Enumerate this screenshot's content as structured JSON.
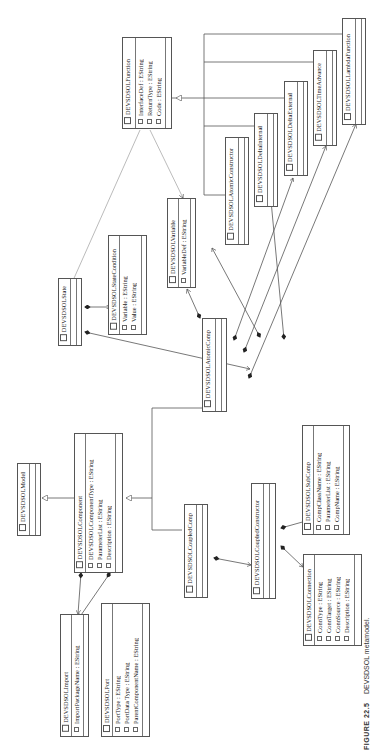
{
  "caption": {
    "label": "FIGURE 22.5",
    "text": "DEVSDSOL metamodel."
  },
  "classes": {
    "function": {
      "name": "DEVSDSOLFunction",
      "attributes": [
        "InterfaceDef : EString",
        "ReturnType : EString",
        "Code : EString"
      ]
    },
    "lambda": {
      "name": "DEVSDSOLLambdaFunction",
      "attributes": []
    },
    "time_advance": {
      "name": "DEVSDSOLTimeAdvance",
      "attributes": []
    },
    "delta_external": {
      "name": "DEVSDSOLDeltaExternal",
      "attributes": []
    },
    "delta_internal": {
      "name": "DEVSDSOLDeltaInternal",
      "attributes": []
    },
    "atomic_constructor": {
      "name": "DEVSDSOLAtomicConstructor",
      "attributes": []
    },
    "variable": {
      "name": "DEVSDSOLVariable",
      "attributes": [
        "VariableDef : EString"
      ]
    },
    "state_condition": {
      "name": "DEVSDSOLStateCondition",
      "attributes": [
        "Variable : EString",
        "Value : EString"
      ]
    },
    "state": {
      "name": "DEVSDSOLState",
      "attributes": []
    },
    "atomic_comp": {
      "name": "DEVSDSOLAtomicComp",
      "attributes": []
    },
    "model": {
      "name": "DEVSDSOLModel",
      "attributes": []
    },
    "component": {
      "name": "DEVSDSOLComponent",
      "attributes": [
        "DEVSDSOLComponentType : EString",
        "ParameterList : EString",
        "Description : EString"
      ]
    },
    "coupled_comp": {
      "name": "DEVSDSOLCoupledComp",
      "attributes": []
    },
    "coupled_constructor": {
      "name": "DEVSDSOLCoupledConstructor",
      "attributes": []
    },
    "sub_comp": {
      "name": "DEVSDSOLSubComp",
      "attributes": [
        "CompClassName : EString",
        "ParameterList : EString",
        "CompName : EString"
      ]
    },
    "connection": {
      "name": "DEVSDSOLConnection",
      "attributes": [
        "ConnType : EString",
        "ConnTarget : EString",
        "ConnSource : EString",
        "Description : EString"
      ]
    },
    "import": {
      "name": "DEVSDSOLImport",
      "attributes": [
        "ImportPackageName : EString"
      ]
    },
    "port": {
      "name": "DEVSDSOLPort",
      "attributes": [
        "PortType : EString",
        "PortData Type : EString",
        "ParentComponentName : EString"
      ]
    }
  },
  "colors": {
    "line": "#555555",
    "light_line": "#aaaaaa",
    "text": "#222222"
  }
}
